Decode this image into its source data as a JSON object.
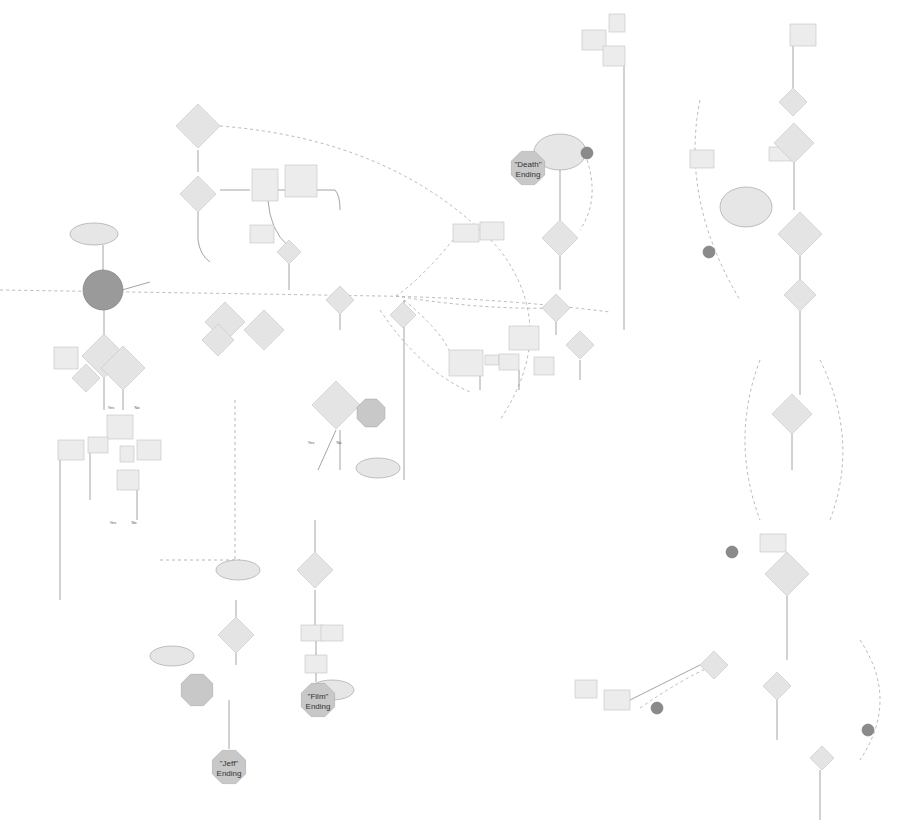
{
  "diagram": {
    "title": "",
    "colors": {
      "background": "#ffffff",
      "stroke": "#9a9a9a",
      "dashed_stroke": "#b0b0b0",
      "node_fill": "#ececec",
      "ending_fill": "#c8c8c8",
      "terminal_fill": "#8a8a8a",
      "text": "#555555"
    },
    "endings": [
      {
        "id": "death",
        "label": "\"Death\" Ending",
        "x": 528,
        "y": 168,
        "r": 18
      },
      {
        "id": "jeff",
        "label": "\"Jeff\" Ending",
        "x": 229,
        "y": 767,
        "r": 18
      },
      {
        "id": "film",
        "label": "\"Film\" Ending",
        "x": 318,
        "y": 700,
        "r": 18
      },
      {
        "id": "forever",
        "label": "",
        "x": 197,
        "y": 690,
        "r": 17
      },
      {
        "id": "mid",
        "label": "",
        "x": 371,
        "y": 413,
        "r": 15
      }
    ],
    "terminals": [
      {
        "id": "t1",
        "x": 103,
        "y": 290,
        "r": 20
      },
      {
        "id": "t2",
        "x": 587,
        "y": 153,
        "r": 6
      },
      {
        "id": "t3",
        "x": 709,
        "y": 252,
        "r": 6
      },
      {
        "id": "t4",
        "x": 732,
        "y": 552,
        "r": 6
      },
      {
        "id": "t5",
        "x": 657,
        "y": 708,
        "r": 6
      },
      {
        "id": "t6",
        "x": 868,
        "y": 730,
        "r": 6
      }
    ],
    "diamonds": [
      {
        "x": 198,
        "y": 126,
        "s": 22
      },
      {
        "x": 198,
        "y": 194,
        "s": 18
      },
      {
        "x": 104,
        "y": 356,
        "s": 22
      },
      {
        "x": 225,
        "y": 322,
        "s": 20
      },
      {
        "x": 264,
        "y": 330,
        "s": 20
      },
      {
        "x": 289,
        "y": 252,
        "s": 12
      },
      {
        "x": 340,
        "y": 300,
        "s": 14
      },
      {
        "x": 123,
        "y": 368,
        "s": 22
      },
      {
        "x": 336,
        "y": 405,
        "s": 24
      },
      {
        "x": 315,
        "y": 570,
        "s": 18
      },
      {
        "x": 236,
        "y": 635,
        "s": 18
      },
      {
        "x": 403,
        "y": 315,
        "s": 13
      },
      {
        "x": 560,
        "y": 238,
        "s": 18
      },
      {
        "x": 556,
        "y": 308,
        "s": 14
      },
      {
        "x": 580,
        "y": 345,
        "s": 14
      },
      {
        "x": 793,
        "y": 102,
        "s": 14
      },
      {
        "x": 794,
        "y": 143,
        "s": 20
      },
      {
        "x": 800,
        "y": 234,
        "s": 22
      },
      {
        "x": 800,
        "y": 295,
        "s": 16
      },
      {
        "x": 792,
        "y": 414,
        "s": 20
      },
      {
        "x": 787,
        "y": 574,
        "s": 22
      },
      {
        "x": 714,
        "y": 665,
        "s": 14
      },
      {
        "x": 777,
        "y": 686,
        "s": 14
      },
      {
        "x": 822,
        "y": 758,
        "s": 12
      },
      {
        "x": 218,
        "y": 340,
        "s": 16
      },
      {
        "x": 86,
        "y": 378,
        "s": 14
      }
    ],
    "rects": [
      {
        "x": 252,
        "y": 169,
        "w": 26,
        "h": 32
      },
      {
        "x": 285,
        "y": 165,
        "w": 32,
        "h": 32
      },
      {
        "x": 250,
        "y": 225,
        "w": 24,
        "h": 18
      },
      {
        "x": 54,
        "y": 347,
        "w": 24,
        "h": 22
      },
      {
        "x": 107,
        "y": 415,
        "w": 26,
        "h": 24
      },
      {
        "x": 58,
        "y": 440,
        "w": 26,
        "h": 20
      },
      {
        "x": 88,
        "y": 437,
        "w": 20,
        "h": 16
      },
      {
        "x": 120,
        "y": 446,
        "w": 14,
        "h": 16
      },
      {
        "x": 137,
        "y": 440,
        "w": 24,
        "h": 20
      },
      {
        "x": 117,
        "y": 470,
        "w": 22,
        "h": 20
      },
      {
        "x": 301,
        "y": 625,
        "w": 22,
        "h": 16
      },
      {
        "x": 321,
        "y": 625,
        "w": 22,
        "h": 16
      },
      {
        "x": 305,
        "y": 655,
        "w": 22,
        "h": 18
      },
      {
        "x": 453,
        "y": 224,
        "w": 26,
        "h": 18
      },
      {
        "x": 480,
        "y": 222,
        "w": 24,
        "h": 18
      },
      {
        "x": 449,
        "y": 350,
        "w": 34,
        "h": 26
      },
      {
        "x": 485,
        "y": 355,
        "w": 14,
        "h": 10
      },
      {
        "x": 499,
        "y": 354,
        "w": 20,
        "h": 16
      },
      {
        "x": 509,
        "y": 326,
        "w": 30,
        "h": 24
      },
      {
        "x": 534,
        "y": 357,
        "w": 20,
        "h": 18
      },
      {
        "x": 582,
        "y": 30,
        "w": 24,
        "h": 20
      },
      {
        "x": 609,
        "y": 14,
        "w": 16,
        "h": 18
      },
      {
        "x": 603,
        "y": 46,
        "w": 22,
        "h": 20
      },
      {
        "x": 790,
        "y": 24,
        "w": 26,
        "h": 22
      },
      {
        "x": 690,
        "y": 150,
        "w": 24,
        "h": 18
      },
      {
        "x": 769,
        "y": 147,
        "w": 26,
        "h": 14
      },
      {
        "x": 575,
        "y": 680,
        "w": 22,
        "h": 18
      },
      {
        "x": 604,
        "y": 690,
        "w": 26,
        "h": 20
      },
      {
        "x": 760,
        "y": 534,
        "w": 26,
        "h": 18
      }
    ],
    "ellipses": [
      {
        "x": 94,
        "y": 234,
        "rx": 24,
        "ry": 11
      },
      {
        "x": 560,
        "y": 152,
        "rx": 26,
        "ry": 18
      },
      {
        "x": 746,
        "y": 207,
        "rx": 26,
        "ry": 20
      },
      {
        "x": 378,
        "y": 468,
        "rx": 22,
        "ry": 10
      },
      {
        "x": 238,
        "y": 570,
        "rx": 22,
        "ry": 10
      },
      {
        "x": 172,
        "y": 656,
        "rx": 22,
        "ry": 10
      },
      {
        "x": 332,
        "y": 690,
        "rx": 22,
        "ry": 10
      }
    ],
    "solid_paths": [
      "M198 150 L198 172",
      "M198 212 L198 240 Q200 255 210 262",
      "M220 190 L250 190",
      "M278 190 L285 190",
      "M317 190 L335 190 Q340 195 340 210",
      "M268 200 Q270 230 288 246",
      "M289 264 L289 290",
      "M103 245 L103 270",
      "M122 290 L150 282",
      "M104 378 L104 410",
      "M340 314 L340 330",
      "M340 430 L340 470",
      "M336 430 L318 470",
      "M315 552 L315 520",
      "M315 590 L315 625",
      "M316 641 L316 655",
      "M316 673 L316 682",
      "M236 617 L236 600",
      "M236 653 L236 665",
      "M229 700 L229 749",
      "M560 170 L560 220",
      "M560 256 L560 290",
      "M556 322 L556 335",
      "M580 360 L580 380",
      "M624 66 L624 330",
      "M793 46 L793 88",
      "M794 163 L794 210",
      "M800 256 L800 280",
      "M800 311 L800 395",
      "M792 434 L792 470",
      "M787 596 L787 660",
      "M700 665 L630 700",
      "M777 700 L777 740",
      "M820 770 L820 820",
      "M404 300 L404 480",
      "M104 300 L104 340",
      "M123 390 L123 410",
      "M137 490 L137 520",
      "M60 460 L60 600",
      "M90 453 L90 500",
      "M480 376 L480 390",
      "M519 370 L519 390"
    ],
    "dashed_paths": [
      "M0 290 Q200 293 380 296 Q500 298 610 312",
      "M220 126 Q400 140 500 250 Q560 330 500 420",
      "M235 400 L235 580",
      "M160 560 L240 560",
      "M700 100 Q680 200 740 300",
      "M820 360 Q860 440 830 520",
      "M760 360 Q730 440 760 520",
      "M860 640 Q900 700 860 760",
      "M587 160 Q600 200 580 230",
      "M640 708 Q680 680 714 665",
      "M396 296 Q420 280 453 240",
      "M404 300 Q440 330 449 350",
      "M380 310 Q420 370 470 392",
      "M396 296 Q480 310 556 308"
    ],
    "legible_labels": [
      {
        "text": "\"Death\"",
        "x": 528,
        "y": 164,
        "big": true
      },
      {
        "text": "Ending",
        "x": 528,
        "y": 174,
        "big": true
      },
      {
        "text": "\"Jeff\"",
        "x": 229,
        "y": 763,
        "big": true
      },
      {
        "text": "Ending",
        "x": 229,
        "y": 773,
        "big": true
      },
      {
        "text": "\"Film\"",
        "x": 318,
        "y": 696,
        "big": true
      },
      {
        "text": "Ending",
        "x": 318,
        "y": 706,
        "big": true
      },
      {
        "text": "Yes",
        "x": 111,
        "y": 407,
        "big": false
      },
      {
        "text": "No",
        "x": 137,
        "y": 407,
        "big": false
      },
      {
        "text": "Yes",
        "x": 113,
        "y": 522,
        "big": false
      },
      {
        "text": "No",
        "x": 134,
        "y": 522,
        "big": false
      },
      {
        "text": "Yes",
        "x": 311,
        "y": 442,
        "big": false
      },
      {
        "text": "No",
        "x": 339,
        "y": 442,
        "big": false
      }
    ]
  }
}
